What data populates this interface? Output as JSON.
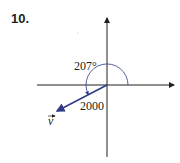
{
  "problem": {
    "number": "10."
  },
  "diagram": {
    "angle_label": "207°",
    "magnitude_label": "2000",
    "vector_label": "v",
    "colors": {
      "axes": "#231f20",
      "vector": "#2e3a87",
      "arc": "#2e3a87"
    }
  }
}
